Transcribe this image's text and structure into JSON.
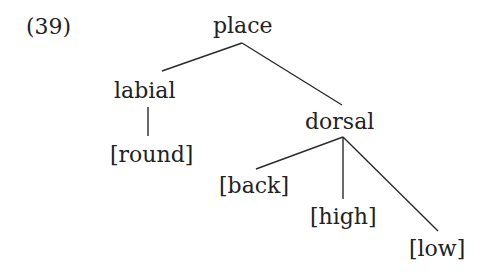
{
  "example": {
    "number": "(39)"
  },
  "tree": {
    "root": "place",
    "nodes": {
      "place": "place",
      "labial": "labial",
      "round": "[round]",
      "dorsal": "dorsal",
      "back": "[back]",
      "high": "[high]",
      "low": "[low]"
    },
    "edges": [
      [
        "place",
        "labial"
      ],
      [
        "place",
        "dorsal"
      ],
      [
        "labial",
        "round"
      ],
      [
        "dorsal",
        "back"
      ],
      [
        "dorsal",
        "high"
      ],
      [
        "dorsal",
        "low"
      ]
    ]
  },
  "colors": {
    "text": "#222222",
    "line": "#2a2a2a",
    "background": "#ffffff"
  }
}
